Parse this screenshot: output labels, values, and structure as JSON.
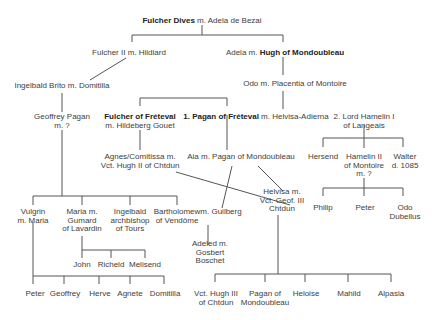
{
  "diagram": {
    "type": "family-tree",
    "nodes": {
      "fulcher_dives": {
        "bold": "Fulcher Dives",
        "rest": " m. Adela de Bezai"
      },
      "fulcher_ii": {
        "text": "Fulcher II m. Hildiard"
      },
      "adela_hugh": {
        "pre": "Adela m. ",
        "bold": "Hugh of Mondoubleau"
      },
      "ingelbald_brito": {
        "text": "Ingelbald Brito m. Domitilla"
      },
      "odo_placentia": {
        "text": "Odo m. Placentia of Montoire"
      },
      "geoffrey_pagan": {
        "lines": [
          "Geoffrey Pagan",
          "m. ?"
        ]
      },
      "fulcher_freteval": {
        "bold": "Fulcher of Fréteval",
        "line2": "m. Hildeberg Gouet"
      },
      "pagan_freteval": {
        "bold": "1. Pagan of Fréteval",
        "rest": " m. Helvisa-Adierna"
      },
      "hamelin_i": {
        "lines": [
          "2. Lord Hamelin I",
          "of Langeais"
        ]
      },
      "agnes": {
        "lines": [
          "Agnes/Comitissa m.",
          "Vct. Hugh II of Chtdun"
        ]
      },
      "aia": {
        "text": "Aia m. Pagan of Mondoubleau"
      },
      "hersend": {
        "text": "Hersend"
      },
      "hamelin_ii": {
        "lines": [
          "Hamelin II",
          "of Montoire",
          "m. ?"
        ]
      },
      "walter": {
        "lines": [
          "Walter",
          "d. 1085"
        ]
      },
      "helvisa": {
        "lines": [
          "Helvisa m.",
          "Vct. Geof. III",
          "Chtdun"
        ]
      },
      "guilberg": {
        "text": "m. Guilberg"
      },
      "philip": {
        "text": "Philip"
      },
      "peter_r": {
        "text": "Peter"
      },
      "odo_dubellus": {
        "lines": [
          "Odo",
          "Dubellus"
        ]
      },
      "vulgrin": {
        "lines": [
          "Vulgrin",
          "m. Maria"
        ]
      },
      "maria": {
        "lines": [
          "Maria m.",
          "Gumard",
          "of Lavardin"
        ]
      },
      "ingelbald_arch": {
        "lines": [
          "Ingelbald",
          "archbishop",
          "of Tours"
        ]
      },
      "bartholomew": {
        "lines": [
          "Bartholomew",
          "of Vendôme"
        ]
      },
      "adeled": {
        "lines": [
          "Adeled m.",
          "Gosbert",
          "Boschet"
        ]
      },
      "john": {
        "text": "John"
      },
      "richeld": {
        "text": "Richeld"
      },
      "melisend": {
        "text": "Melisend"
      },
      "peter_l": {
        "text": "Peter"
      },
      "geoffrey": {
        "text": "Geoffrey"
      },
      "herve": {
        "text": "Herve"
      },
      "agnete": {
        "text": "Agnete"
      },
      "domitilla": {
        "text": "Domitilla"
      },
      "vct_hugh_iii": {
        "lines": [
          "Vct. Hugh III",
          "of Chtdun"
        ]
      },
      "pagan_mond": {
        "lines": [
          "Pagan of",
          "Mondoubleau"
        ]
      },
      "heloise": {
        "text": "Heloise"
      },
      "mahild": {
        "text": "Mahild"
      },
      "alpasia": {
        "text": "Alpasia"
      }
    }
  }
}
